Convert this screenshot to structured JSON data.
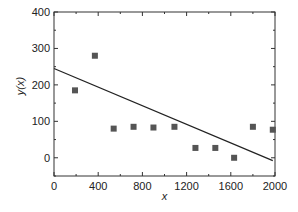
{
  "chart_data": {
    "type": "scatter",
    "title": "",
    "xlabel": "x",
    "ylabel": "y(x)",
    "xlim": [
      0,
      2000
    ],
    "ylim": [
      -50,
      400
    ],
    "xticks": [
      0,
      400,
      800,
      1200,
      1600,
      2000
    ],
    "yticks": [
      0,
      100,
      200,
      300,
      400
    ],
    "grid": false,
    "legend": null,
    "series": [
      {
        "name": "data",
        "type": "scatter",
        "marker": "square",
        "color": "#555555",
        "x": [
          190,
          370,
          540,
          720,
          900,
          1090,
          1280,
          1460,
          1630,
          1800,
          1980
        ],
        "y": [
          185,
          280,
          80,
          85,
          83,
          85,
          27,
          27,
          0,
          85,
          77
        ]
      },
      {
        "name": "fit",
        "type": "line",
        "color": "#222222",
        "x": [
          0,
          1980
        ],
        "y": [
          245,
          -8
        ]
      }
    ]
  }
}
